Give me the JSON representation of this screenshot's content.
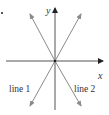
{
  "diagram": {
    "type": "coordinate-axes-with-lines",
    "axes": {
      "x_label": "x",
      "y_label": "y",
      "origin": [
        55,
        61
      ],
      "color": "#555555"
    },
    "lines": [
      {
        "label": "line 1",
        "slope_sign": "positive",
        "from": [
          30,
          106
        ],
        "to": [
          81,
          14
        ],
        "color": "#8a8a8a"
      },
      {
        "label": "line 2",
        "slope_sign": "negative",
        "from": [
          30,
          14
        ],
        "to": [
          81,
          106
        ],
        "color": "#8a8a8a"
      }
    ]
  }
}
